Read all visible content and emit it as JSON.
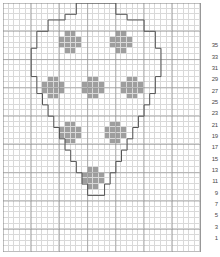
{
  "chart_data": {
    "type": "heatmap",
    "title": "",
    "xlabel": "",
    "ylabel": "",
    "grid": {
      "columns": 35,
      "rows": 44
    },
    "legend": [],
    "colors": {
      "filled": "#9e9e9e",
      "empty": "#ffffff",
      "gridline": "#d9d9d9",
      "heavy_gridline": "#8a8a8a",
      "outline": "#555555",
      "row_number_text": "#4a4a4a"
    },
    "axis": {
      "row_numbers_side": "right",
      "row_numbers": [
        1,
        3,
        5,
        7,
        9,
        11,
        13,
        15,
        17,
        19,
        21,
        23,
        25,
        27,
        29,
        31,
        33,
        35
      ],
      "row_number_start_row_from_bottom": 3,
      "row_number_step_rows": 2,
      "grid_on": true
    },
    "heavy_gridlines": {
      "vertical_every": 5,
      "horizontal_every": 5
    },
    "outline_path_cells": [
      [
        14,
        1
      ],
      [
        21,
        1
      ],
      [
        21,
        3
      ],
      [
        23,
        3
      ],
      [
        23,
        4
      ],
      [
        26,
        4
      ],
      [
        26,
        6
      ],
      [
        28,
        6
      ],
      [
        28,
        9
      ],
      [
        29,
        9
      ],
      [
        29,
        14
      ],
      [
        28,
        14
      ],
      [
        28,
        17
      ],
      [
        27,
        17
      ],
      [
        27,
        19
      ],
      [
        26,
        19
      ],
      [
        26,
        21
      ],
      [
        25,
        21
      ],
      [
        25,
        23
      ],
      [
        24,
        23
      ],
      [
        24,
        25
      ],
      [
        23,
        25
      ],
      [
        23,
        27
      ],
      [
        22,
        27
      ],
      [
        22,
        29
      ],
      [
        21,
        29
      ],
      [
        21,
        31
      ],
      [
        20,
        31
      ],
      [
        20,
        33
      ],
      [
        19,
        33
      ],
      [
        19,
        35
      ],
      [
        16,
        35
      ],
      [
        16,
        33
      ],
      [
        15,
        33
      ],
      [
        15,
        31
      ],
      [
        14,
        31
      ],
      [
        14,
        29
      ],
      [
        13,
        29
      ],
      [
        13,
        27
      ],
      [
        12,
        27
      ],
      [
        12,
        25
      ],
      [
        11,
        25
      ],
      [
        11,
        23
      ],
      [
        10,
        23
      ],
      [
        10,
        21
      ],
      [
        9,
        21
      ],
      [
        9,
        19
      ],
      [
        8,
        19
      ],
      [
        8,
        17
      ],
      [
        7,
        17
      ],
      [
        7,
        14
      ],
      [
        6,
        14
      ],
      [
        6,
        9
      ],
      [
        7,
        9
      ],
      [
        7,
        6
      ],
      [
        9,
        6
      ],
      [
        9,
        4
      ],
      [
        12,
        4
      ],
      [
        12,
        3
      ],
      [
        14,
        3
      ],
      [
        14,
        1
      ]
    ],
    "motifs": [
      {
        "name": "plus-top-left",
        "center_col": 13,
        "center_row": 8
      },
      {
        "name": "plus-top-right",
        "center_col": 22,
        "center_row": 8
      },
      {
        "name": "plus-mid-left",
        "center_col": 10,
        "center_row": 16
      },
      {
        "name": "plus-mid-center",
        "center_col": 17,
        "center_row": 16
      },
      {
        "name": "plus-mid-right",
        "center_col": 24,
        "center_row": 16
      },
      {
        "name": "plus-low-left",
        "center_col": 13,
        "center_row": 24
      },
      {
        "name": "plus-low-right",
        "center_col": 21,
        "center_row": 24
      },
      {
        "name": "plus-bottom",
        "center_col": 17,
        "center_row": 32
      }
    ],
    "motif_shape": {
      "name": "plus",
      "offsets": [
        [
          -1,
          -2
        ],
        [
          0,
          -2
        ],
        [
          -2,
          -1
        ],
        [
          -1,
          -1
        ],
        [
          0,
          -1
        ],
        [
          1,
          -1
        ],
        [
          -2,
          0
        ],
        [
          -1,
          0
        ],
        [
          0,
          0
        ],
        [
          1,
          0
        ],
        [
          -1,
          1
        ],
        [
          0,
          1
        ]
      ]
    }
  }
}
